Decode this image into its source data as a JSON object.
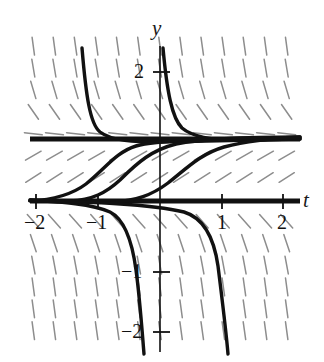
{
  "figure": {
    "kind": "direction-field-with-solution-curves",
    "axis_labels": {
      "x": "t",
      "y": "y"
    },
    "stroke_color": "#111111",
    "field_color": "#8d8d8d"
  },
  "chart_data": {
    "type": "line",
    "title": "",
    "xlabel": "t",
    "ylabel": "y",
    "xlim": [
      -2.2,
      2.2
    ],
    "ylim": [
      -2.4,
      2.45
    ],
    "grid": false,
    "legend": null,
    "x_ticks": [
      -2,
      -1,
      1,
      2
    ],
    "x_tick_labels": [
      "−2",
      "−1",
      "1",
      "2"
    ],
    "y_ticks": [
      2,
      -1,
      -2
    ],
    "y_tick_labels": [
      "2",
      "−1",
      "−2"
    ],
    "equilibria": [
      {
        "y": 1,
        "stability": "stable",
        "drawn_as": "thick-horizontal-line"
      },
      {
        "y": 0,
        "stability": "unstable",
        "drawn_as": "thick-horizontal-line"
      }
    ],
    "slope_field": {
      "description": "short tick segments showing dy/dt sign",
      "x_range": [
        -2.05,
        2.05
      ],
      "y_range": [
        -2.35,
        2.4
      ],
      "nx": 13,
      "ny": 15,
      "rule": "slope = k*y*(y-1), negative between y=0 and y=1 inverted: solutions rise toward y=1 from above 0 and fall toward y=1 from above 1"
    },
    "series": [
      {
        "name": "curve-above-1-left",
        "role": "decays to y=1 from +infinity",
        "asymptote_t": -1.35,
        "approaches_y": 1
      },
      {
        "name": "curve-above-1-right",
        "role": "decays to y=1 from +infinity",
        "asymptote_t": -0.07,
        "approaches_y": 1
      },
      {
        "name": "curve-between-0-1-a",
        "role": "rises from y=0 toward y=1",
        "through": [
          -1.6,
          0.02
        ],
        "approaches_y": 1
      },
      {
        "name": "curve-between-0-1-b",
        "role": "rises from y=0 toward y=1",
        "through": [
          -1.0,
          0.02
        ],
        "approaches_y": 1
      },
      {
        "name": "curve-between-0-1-c",
        "role": "rises from y=0 toward y=1",
        "through": [
          -0.3,
          0.02
        ],
        "approaches_y": 1
      },
      {
        "name": "curve-below-0-left",
        "role": "falls from y=0 to -infinity",
        "asymptote_t": -0.32,
        "approaches_y": "-infinity"
      },
      {
        "name": "curve-below-0-right",
        "role": "falls from y=0 to -infinity",
        "asymptote_t": 0.72,
        "approaches_y": "-infinity"
      }
    ]
  },
  "labels": {
    "y_axis": "y",
    "t_axis": "t",
    "x_neg2": "−2",
    "x_neg1": "−1",
    "x_pos1": "1",
    "x_pos2": "2",
    "y_pos2": "2",
    "y_neg1": "−1",
    "y_neg2": "−2"
  }
}
